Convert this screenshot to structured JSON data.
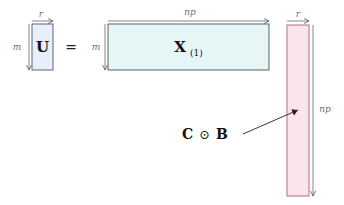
{
  "diagram": {
    "equation_sign": "=",
    "matrices": [
      {
        "id": "U",
        "label": "U",
        "rows_label": "m",
        "cols_label": "r",
        "fill": "#e8effa",
        "stroke": "#4a5a6a"
      },
      {
        "id": "X1",
        "label": "X",
        "subscript": "(1)",
        "rows_label": "m",
        "cols_label": "np",
        "fill": "#e6f6f7",
        "stroke": "#3e5a50"
      },
      {
        "id": "CB",
        "label": "C ⊙ B",
        "rows_label": "np",
        "cols_label": "r",
        "fill": "#fbe5ea",
        "stroke": "#b0606c"
      }
    ],
    "annotation": {
      "text_left": "C",
      "operator": "⊙",
      "text_right": "B",
      "points_to": "CB"
    }
  }
}
